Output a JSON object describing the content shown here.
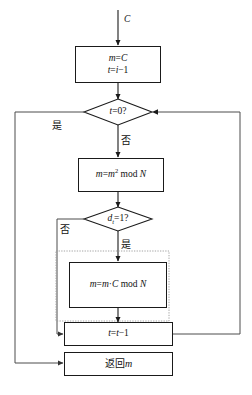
{
  "diagram": {
    "type": "flowchart",
    "colors": {
      "stroke": "#1a1a1a",
      "line": "#4d4d4d",
      "dotted": "#999999",
      "background": "#ffffff"
    },
    "input_label": "C",
    "nodes": [
      {
        "id": "init",
        "shape": "process",
        "lines": [
          "m=C",
          "t=i−1"
        ]
      },
      {
        "id": "check-t-zero",
        "shape": "decision",
        "text": "t=0?"
      },
      {
        "id": "square-mod",
        "shape": "process",
        "text": "m=m² mod N"
      },
      {
        "id": "check-bit",
        "shape": "decision",
        "text": "dₜ=1?"
      },
      {
        "id": "multiply-mod",
        "shape": "process",
        "text": "m=m·C mod N"
      },
      {
        "id": "decrement-t",
        "shape": "process",
        "text": "t=t−1"
      },
      {
        "id": "return-m",
        "shape": "process",
        "text": "返回m"
      }
    ],
    "edge_labels": {
      "t_zero_yes": "是",
      "t_zero_no": "否",
      "bit_no": "否",
      "bit_yes": "是"
    }
  }
}
